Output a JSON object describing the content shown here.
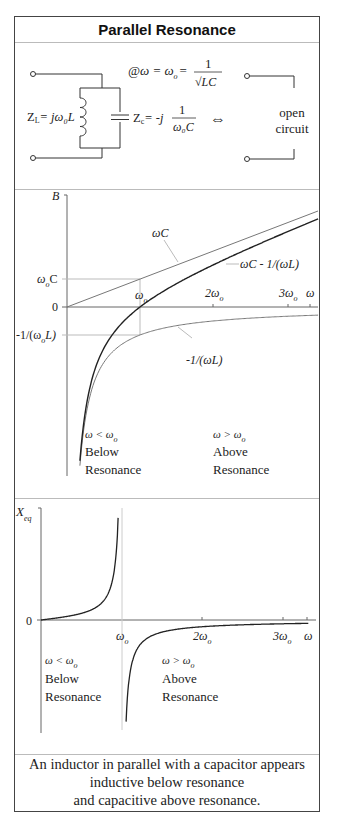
{
  "title": "Parallel Resonance",
  "circuit": {
    "resonance_condition": "@ω = ωo = 1/√LC",
    "resonance_lhs": "@ω = ω",
    "resonance_sub": "o",
    "resonance_eq": "=",
    "resonance_num": "1",
    "resonance_den": "√LC",
    "inductor_label": "Z",
    "inductor_label_sub": "L",
    "inductor_expr": "= jω₀L",
    "capacitor_label": "Z",
    "capacitor_label_sub": "c",
    "capacitor_expr": "= -j",
    "capacitor_num": "1",
    "capacitor_den": "ω₀C",
    "equivalence_symbol": "⇔",
    "open_line1": "open",
    "open_line2": "circuit"
  },
  "chart_data": [
    {
      "type": "line",
      "title": "Susceptance vs frequency",
      "ylabel": "B",
      "xlabel": "ω",
      "x_ticks": [
        "ωo",
        "2ωo",
        "3ωo",
        "ω"
      ],
      "y_ticks": [
        "ωoC",
        "0",
        "-1/(ωoL)"
      ],
      "series": [
        {
          "name": "ωC",
          "x": [
            0,
            1,
            2,
            3,
            3.44
          ],
          "values": [
            0,
            1,
            2,
            3,
            3.44
          ]
        },
        {
          "name": "-1/(ωL)",
          "x": [
            0.15,
            0.25,
            0.5,
            1,
            2,
            3,
            3.44
          ],
          "values": [
            -6.67,
            -4,
            -2,
            -1,
            -0.5,
            -0.33,
            -0.29
          ]
        },
        {
          "name": "ωC - 1/(ωL)",
          "x": [
            0.15,
            0.25,
            0.5,
            1,
            2,
            3,
            3.44
          ],
          "values": [
            -6.52,
            -3.75,
            -1.5,
            0,
            1.5,
            2.67,
            3.15
          ]
        }
      ],
      "annotations": [
        "ω < ωo",
        "Below Resonance",
        "ω > ωo",
        "Above Resonance"
      ],
      "grid": false
    },
    {
      "type": "line",
      "title": "Equivalent reactance vs frequency",
      "ylabel": "Xeq",
      "xlabel": "ω",
      "x_ticks": [
        "ωo",
        "2ωo",
        "3ωo",
        "ω"
      ],
      "y_ticks": [
        "0"
      ],
      "series": [
        {
          "name": "Xeq below resonance",
          "x": [
            0,
            0.25,
            0.5,
            0.75,
            0.9,
            0.95
          ],
          "values": [
            0,
            0.27,
            0.67,
            1.71,
            4.74,
            9.74
          ]
        },
        {
          "name": "Xeq above resonance",
          "x": [
            1.03,
            1.1,
            1.25,
            1.5,
            2,
            3,
            3.3
          ],
          "values": [
            -16.9,
            -5.24,
            -2.22,
            -1.2,
            -0.67,
            -0.38,
            -0.33
          ]
        }
      ],
      "annotations": [
        "ω < ωo",
        "Below Resonance",
        "ω > ωo",
        "Above Resonance"
      ],
      "grid": false
    }
  ],
  "chart1": {
    "y_label": "B",
    "tick_w0c": "ω",
    "tick_w0c_sub": "o",
    "tick_w0c_tail": "C",
    "tick_zero": "0",
    "tick_neg_pre": "-1/(ω",
    "tick_neg_sub": "o",
    "tick_neg_tail": "L)",
    "x_w0": "ω",
    "x_w0_sub": "o",
    "x_2w0": "2ω",
    "x_2w0_sub": "o",
    "x_3w0": "3ω",
    "x_3w0_sub": "o",
    "x_w": "ω",
    "curve_wc": "ωC",
    "curve_sum": "ωC - 1/(ωL)",
    "curve_neg": "-1/(ωL)",
    "below_cond": "ω < ω",
    "below_cond_sub": "o",
    "below_l1": "Below",
    "below_l2": "Resonance",
    "above_cond": "ω > ω",
    "above_cond_sub": "o",
    "above_l1": "Above",
    "above_l2": "Resonance"
  },
  "chart2": {
    "y_label": "X",
    "y_label_sub": "eq",
    "tick_zero": "0",
    "x_w0": "ω",
    "x_w0_sub": "o",
    "x_2w0": "2ω",
    "x_2w0_sub": "o",
    "x_3w0": "3ω",
    "x_3w0_sub": "o",
    "x_w": "ω",
    "below_cond": "ω < ω",
    "below_cond_sub": "o",
    "below_l1": "Below",
    "below_l2": "Resonance",
    "above_cond": "ω > ω",
    "above_cond_sub": "o",
    "above_l1": "Above",
    "above_l2": "Resonance"
  },
  "caption": {
    "line1": "An inductor in parallel with a capacitor appears",
    "line2": "inductive below resonance",
    "line3": "and capacitive above resonance."
  }
}
